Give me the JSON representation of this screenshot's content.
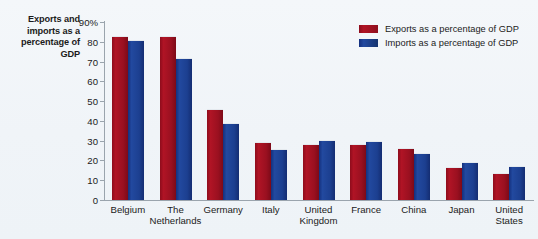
{
  "chart_data": {
    "type": "bar",
    "title": "",
    "ylabel": "Exports and imports as a percentage of GDP",
    "xlabel": "",
    "ylim": [
      0,
      90
    ],
    "yticks": [
      "90%",
      "80",
      "70",
      "60",
      "50",
      "40",
      "30",
      "20",
      "10",
      "0"
    ],
    "ytick_values": [
      90,
      80,
      70,
      60,
      50,
      40,
      30,
      20,
      10,
      0
    ],
    "grid": false,
    "legend_position": "top-right",
    "categories": [
      "Belgium",
      "The\nNetherlands",
      "Germany",
      "Italy",
      "United\nKingdom",
      "France",
      "China",
      "Japan",
      "United\nStates"
    ],
    "series": [
      {
        "name": "Exports as a percentage of GDP",
        "color": "#a81020",
        "values": [
          83,
          83,
          46,
          29.5,
          28.5,
          28.5,
          26.5,
          16.5,
          13.5
        ]
      },
      {
        "name": "Imports as a percentage of GDP",
        "color": "#1a44a8",
        "values": [
          81,
          72,
          39,
          26,
          30.5,
          30,
          24,
          19,
          17
        ]
      }
    ]
  },
  "legend": {
    "items": [
      {
        "label": "Exports as a percentage of GDP"
      },
      {
        "label": "Imports as a percentage of GDP"
      }
    ]
  }
}
